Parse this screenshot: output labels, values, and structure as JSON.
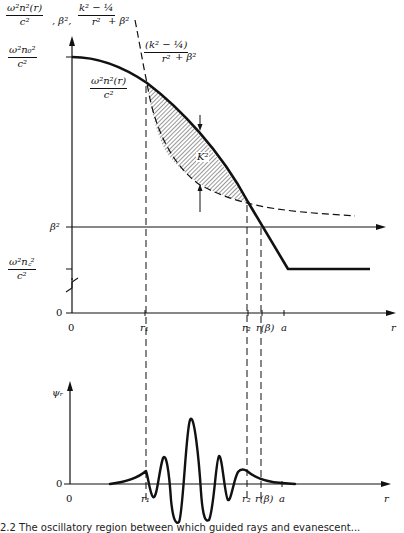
{
  "top_panel": {
    "y_axis_title": {
      "part1_num": "ω²n²(r)",
      "part1_den": "c²",
      "sep1": ", β², ",
      "part2_num": "k² − ¼",
      "part2_den": "r²",
      "part2_tail": " + β²"
    },
    "y_ticks": {
      "core_num": "ω²n₀²",
      "core_den": "c²",
      "beta": "β²",
      "clad_num": "ω²n꜀²",
      "clad_den": "c²",
      "zero": "0"
    },
    "curve_labels": {
      "index_num": "ω²n²(r)",
      "index_den": "c²",
      "centrifugal_num": "(k² − ¼)",
      "centrifugal_den": "r²",
      "centrifugal_tail": " + β²",
      "shaded_region": "K²"
    },
    "x_ticks": [
      "0",
      "r₁",
      "r₂",
      "r(β)",
      "a",
      "r"
    ]
  },
  "bottom_panel": {
    "y_axis_title": "ψᵣ",
    "y_zero": "0",
    "x_ticks": [
      "0",
      "r₁",
      "r₂",
      "r(β)",
      "a",
      "r"
    ]
  },
  "caption": "2.2   The oscillatory region between which guided rays and evanescent..."
}
